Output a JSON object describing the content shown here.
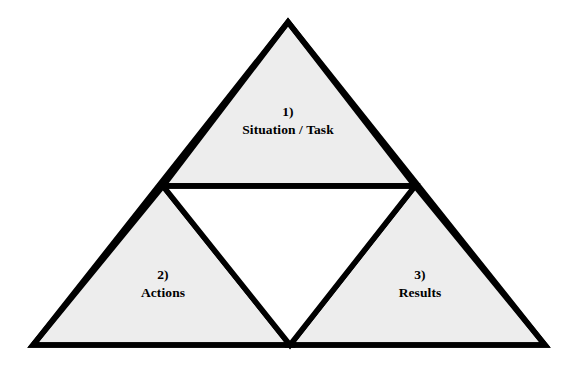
{
  "diagram": {
    "type": "pyramid-triangle-diagram",
    "shape": "triangle",
    "background_color": "#FFFFFF",
    "fill_color": "#EDEDED",
    "inner_fill_color": "#FFFFFF",
    "stroke_color": "#000000",
    "stroke_width": 5.5,
    "outer_vertices": {
      "apex": [
        288,
        22
      ],
      "bottom_left": [
        33,
        345
      ],
      "bottom_right": [
        545,
        345
      ]
    },
    "divider_line": {
      "from": [
        163,
        186
      ],
      "to": [
        415,
        186
      ]
    },
    "inner_triangle_vertices": {
      "top_left": [
        163,
        186
      ],
      "top_right": [
        415,
        186
      ],
      "bottom": [
        290,
        345
      ]
    },
    "regions": [
      {
        "id": "situation-task",
        "index": "1)",
        "label": "Situation / Task",
        "position": "top"
      },
      {
        "id": "actions",
        "index": "2)",
        "label": "Actions",
        "position": "bottom-left"
      },
      {
        "id": "results",
        "index": "3)",
        "label": "Results",
        "position": "bottom-right"
      }
    ]
  }
}
